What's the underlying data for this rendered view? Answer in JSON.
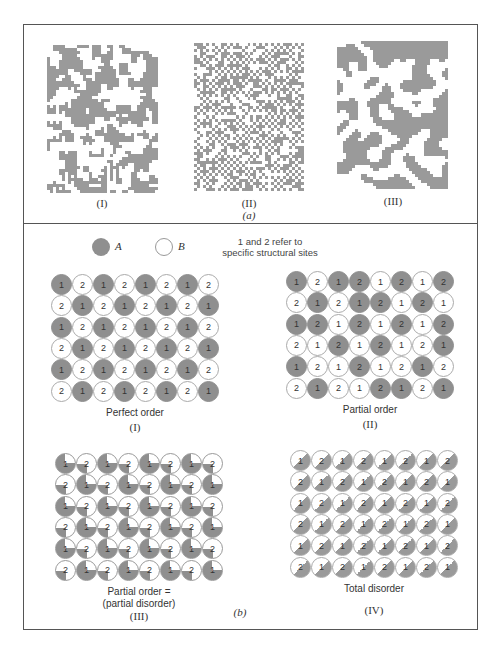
{
  "figure": {
    "part_a": {
      "label": "(a)",
      "panels": [
        {
          "label": "(I)",
          "description": "mixed short-range clustering",
          "density": 0.5,
          "cluster": 1
        },
        {
          "label": "(II)",
          "description": "fine checkerboard-like alternation",
          "density": 0.5,
          "cluster": 0
        },
        {
          "label": "(III)",
          "description": "large clustered domains",
          "density": 0.5,
          "cluster": 2
        }
      ]
    },
    "part_b": {
      "label": "(b)",
      "legend": {
        "a_label": "A",
        "b_label": "B",
        "note_line1": "1 and 2 refer to",
        "note_line2": "specific structural sites"
      },
      "grids": [
        {
          "roman": "(I)",
          "caption_line1": "Perfect order",
          "caption_line2": "",
          "style": "solid",
          "rows": [
            [
              "1g",
              "2w",
              "1g",
              "2w",
              "1g",
              "2w",
              "1g",
              "2w"
            ],
            [
              "2w",
              "1g",
              "2w",
              "1g",
              "2w",
              "1g",
              "2w",
              "1g"
            ],
            [
              "1g",
              "2w",
              "1g",
              "2w",
              "1g",
              "2w",
              "1g",
              "2w"
            ],
            [
              "2w",
              "1g",
              "2w",
              "1g",
              "2w",
              "1g",
              "2w",
              "1g"
            ],
            [
              "1g",
              "2w",
              "1g",
              "2w",
              "1g",
              "2w",
              "1g",
              "2w"
            ],
            [
              "2w",
              "1g",
              "2w",
              "1g",
              "2w",
              "1g",
              "2w",
              "1g"
            ]
          ]
        },
        {
          "roman": "(II)",
          "caption_line1": "Partial order",
          "caption_line2": "",
          "style": "solid",
          "rows": [
            [
              "1g",
              "2w",
              "1g",
              "2g",
              "1w",
              "2g",
              "1w",
              "2g"
            ],
            [
              "2w",
              "1g",
              "2w",
              "1g",
              "2g",
              "1w",
              "2g",
              "1w"
            ],
            [
              "1g",
              "2g",
              "1w",
              "2g",
              "1w",
              "2g",
              "1w",
              "2g"
            ],
            [
              "2w",
              "1w",
              "2g",
              "1w",
              "2g",
              "1w",
              "2w",
              "1g"
            ],
            [
              "1g",
              "2w",
              "1w",
              "2g",
              "1w",
              "2w",
              "1g",
              "2w"
            ],
            [
              "2w",
              "1g",
              "2w",
              "1w",
              "2g",
              "1g",
              "2w",
              "1g"
            ]
          ]
        },
        {
          "roman": "(III)",
          "caption_line1": "Partial order =",
          "caption_line2": "(partial disorder)",
          "style": "pie",
          "rows": [
            [
              "1p",
              "2p",
              "1p",
              "2p",
              "1p",
              "2p",
              "1p",
              "2p"
            ],
            [
              "2p",
              "1p",
              "2p",
              "1p",
              "2p",
              "1p",
              "2p",
              "1p"
            ],
            [
              "1p",
              "2p",
              "1p",
              "2p",
              "1p",
              "2p",
              "1p",
              "2p"
            ],
            [
              "2p",
              "1p",
              "2p",
              "1p",
              "2p",
              "1p",
              "2p",
              "1p"
            ],
            [
              "1p",
              "2p",
              "1p",
              "2p",
              "1p",
              "2p",
              "1p",
              "2p"
            ],
            [
              "2p",
              "1p",
              "2p",
              "1p",
              "2p",
              "1p",
              "2p",
              "1p"
            ]
          ]
        },
        {
          "roman": "(IV)",
          "caption_line1": "Total disorder",
          "caption_line2": "",
          "style": "half",
          "rows": [
            [
              "1h",
              "2h",
              "1h",
              "2h",
              "1h",
              "2h",
              "1h",
              "2h"
            ],
            [
              "2h",
              "1h",
              "2h",
              "1h",
              "2h",
              "1h",
              "2h",
              "1h"
            ],
            [
              "1h",
              "2h",
              "1h",
              "2h",
              "1h",
              "2h",
              "1h",
              "2h"
            ],
            [
              "2h",
              "1h",
              "2h",
              "1h",
              "2h",
              "1h",
              "2h",
              "1h"
            ],
            [
              "1h",
              "2h",
              "1h",
              "2h",
              "1h",
              "2h",
              "1h",
              "2h"
            ],
            [
              "2h",
              "1h",
              "2h",
              "1h",
              "2h",
              "1h",
              "2h",
              "1h"
            ]
          ]
        }
      ]
    },
    "colors": {
      "atom_a": "#8f8f8f",
      "atom_b": "#ffffff",
      "frame": "#555555",
      "mosaic": "#9a9a9a"
    }
  }
}
